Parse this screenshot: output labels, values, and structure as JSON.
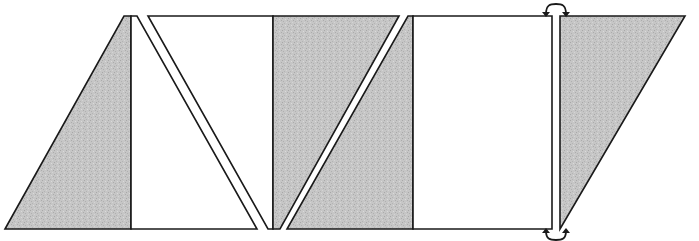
{
  "diagram": {
    "title": "",
    "colors": {
      "shaded": "#c4c4c4",
      "unshaded": "#ffffff",
      "outline": "#1a1a1a"
    },
    "pieces": [
      {
        "id": "piece-1",
        "kind": "right-triangle",
        "fill": "shaded",
        "points": "5,229 124,16 131,16 131,229"
      },
      {
        "id": "piece-2",
        "kind": "triangle",
        "fill": "unshaded",
        "points": "131,16 137,16 257,229 131,229"
      },
      {
        "id": "piece-3",
        "kind": "trapezoid",
        "fill": "unshaded",
        "points": "148,16 273,16 273,229 268,229"
      },
      {
        "id": "piece-4",
        "kind": "quadrilateral",
        "fill": "shaded",
        "points": "273,16 399,16 280,229 273,229"
      },
      {
        "id": "piece-5",
        "kind": "quadrilateral",
        "fill": "shaded",
        "points": "408,16 413,16 413,229 287,229"
      },
      {
        "id": "piece-6",
        "kind": "rectangle",
        "fill": "unshaded",
        "points": "413,16 552,16 552,229 413,229"
      },
      {
        "id": "piece-7",
        "kind": "right-triangle",
        "fill": "shaded",
        "points": "560,16 685,16 560,229"
      }
    ],
    "arrows": [
      {
        "id": "top-swap-arrow",
        "position": "top",
        "from_x": 546,
        "to_x": 566,
        "y": 14
      },
      {
        "id": "bottom-swap-arrow",
        "position": "bottom",
        "from_x": 546,
        "to_x": 566,
        "y": 231
      }
    ]
  }
}
